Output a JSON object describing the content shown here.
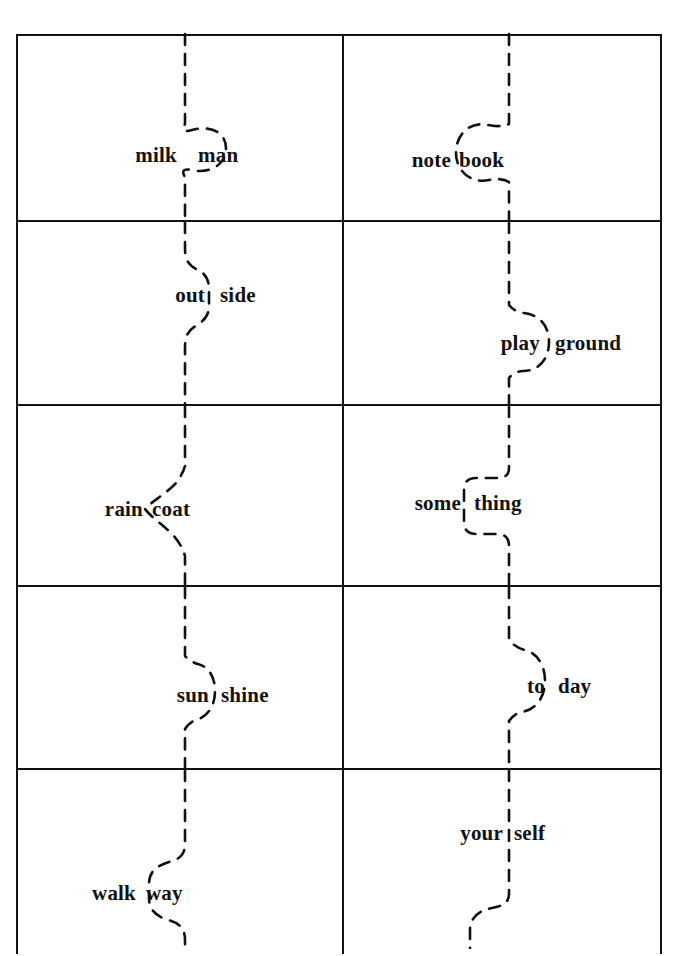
{
  "page": {
    "background_color": "#ffffff",
    "line_color": "#111111",
    "width": 676,
    "height": 949
  },
  "grid": {
    "columns": 2,
    "rows": 5,
    "frame": {
      "left": 16,
      "top": 34,
      "width": 646,
      "height": 920
    },
    "column_divider_x": 340,
    "row_boundaries_y": [
      34,
      220,
      404,
      585,
      768,
      954
    ]
  },
  "cells": [
    {
      "id": "cell-1-1",
      "row": 1,
      "column": 1,
      "compound_word": "milkman",
      "left_word": "milk",
      "right_word": "man",
      "cut_shape": "jigsaw-knob-right",
      "split_x": 185,
      "text_y": 155,
      "left_text_x": 177,
      "right_text_x": 198
    },
    {
      "id": "cell-1-2",
      "row": 1,
      "column": 2,
      "compound_word": "notebook",
      "left_word": "note",
      "right_word": "book",
      "cut_shape": "jigsaw-knob-left",
      "split_x": 509,
      "text_y": 160,
      "left_text_x": 451,
      "right_text_x": 459
    },
    {
      "id": "cell-2-1",
      "row": 2,
      "column": 1,
      "compound_word": "outside",
      "left_word": "out",
      "right_word": "side",
      "cut_shape": "s-curve-right",
      "split_x": 185,
      "text_y": 295,
      "left_text_x": 207,
      "right_text_x": 220
    },
    {
      "id": "cell-2-2",
      "row": 2,
      "column": 2,
      "compound_word": "playground",
      "left_word": "play",
      "right_word": "ground",
      "cut_shape": "round-bulge-right",
      "split_x": 509,
      "text_y": 343,
      "left_text_x": 540,
      "right_text_x": 555
    },
    {
      "id": "cell-3-1",
      "row": 3,
      "column": 1,
      "compound_word": "raincoat",
      "left_word": "rain",
      "right_word": "coat",
      "cut_shape": "v-notch-left",
      "split_x": 185,
      "text_y": 509,
      "left_text_x": 143,
      "right_text_x": 152
    },
    {
      "id": "cell-3-2",
      "row": 3,
      "column": 2,
      "compound_word": "something",
      "left_word": "some",
      "right_word": "thing",
      "cut_shape": "square-jog-left",
      "split_x": 509,
      "text_y": 503,
      "left_text_x": 461,
      "right_text_x": 474
    },
    {
      "id": "cell-4-1",
      "row": 4,
      "column": 1,
      "compound_word": "sunshine",
      "left_word": "sun",
      "right_word": "shine",
      "cut_shape": "round-bulge-right",
      "split_x": 185,
      "text_y": 695,
      "left_text_x": 209,
      "right_text_x": 221
    },
    {
      "id": "cell-4-2",
      "row": 4,
      "column": 2,
      "compound_word": "today",
      "left_word": "to",
      "right_word": "day",
      "cut_shape": "round-bulge-right",
      "split_x": 509,
      "text_y": 686,
      "left_text_x": 545,
      "right_text_x": 558
    },
    {
      "id": "cell-5-1",
      "row": 5,
      "column": 1,
      "compound_word": "walkway",
      "left_word": "walk",
      "right_word": "way",
      "cut_shape": "s-curve-left",
      "split_x": 185,
      "text_y": 893,
      "left_text_x": 136,
      "right_text_x": 146
    },
    {
      "id": "cell-5-2",
      "row": 5,
      "column": 2,
      "compound_word": "yourself",
      "left_word": "your",
      "right_word": "self",
      "cut_shape": "s-curve-left-low",
      "split_x": 509,
      "text_y": 833,
      "left_text_x": 503,
      "right_text_x": 514
    }
  ]
}
